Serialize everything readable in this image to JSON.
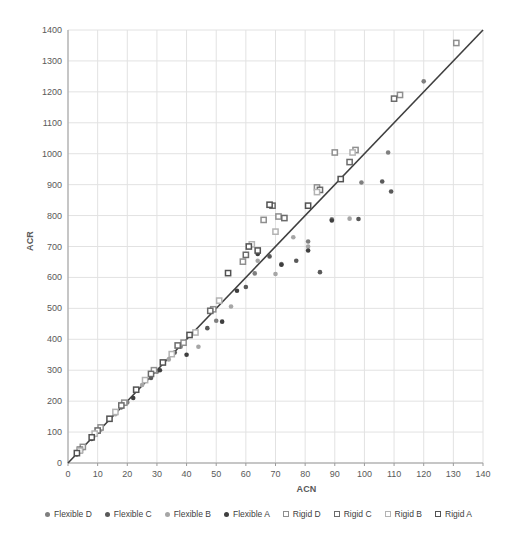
{
  "chart_data": {
    "type": "scatter",
    "title": "",
    "xlabel": "ACN",
    "ylabel": "ACR",
    "xlim": [
      0,
      140
    ],
    "ylim": [
      0,
      1400
    ],
    "xticks": [
      0,
      10,
      20,
      30,
      40,
      50,
      60,
      70,
      80,
      90,
      100,
      110,
      120,
      130,
      140
    ],
    "yticks": [
      0,
      100,
      200,
      300,
      400,
      500,
      600,
      700,
      800,
      900,
      1000,
      1100,
      1200,
      1300,
      1400
    ],
    "grid": true,
    "gridline_color": "#e2e2e2",
    "axis_line_color": "#9b9b9b",
    "tick_label_color": "#595959",
    "legend_position": "bottom",
    "reference_line": {
      "from": [
        0,
        0
      ],
      "to": [
        140,
        1400
      ],
      "color": "#3f3f3f",
      "width": 1.6
    },
    "series": [
      {
        "name": "Flexible D",
        "marker": "circle",
        "color": "#7f7f7f",
        "points": [
          [
            5,
            48
          ],
          [
            11,
            108
          ],
          [
            20,
            196
          ],
          [
            30,
            295
          ],
          [
            38,
            376
          ],
          [
            50,
            460
          ],
          [
            63,
            613
          ],
          [
            72,
            643
          ],
          [
            81,
            716
          ],
          [
            89,
            788
          ],
          [
            99,
            907
          ],
          [
            108,
            1004
          ],
          [
            120,
            1234
          ]
        ]
      },
      {
        "name": "Flexible C",
        "marker": "circle",
        "color": "#595959",
        "points": [
          [
            4,
            40
          ],
          [
            10,
            100
          ],
          [
            18,
            180
          ],
          [
            28,
            275
          ],
          [
            36,
            357
          ],
          [
            47,
            436
          ],
          [
            60,
            569
          ],
          [
            68,
            668
          ],
          [
            77,
            654
          ],
          [
            85,
            617
          ],
          [
            98,
            789
          ],
          [
            106,
            910
          ],
          [
            109,
            878
          ]
        ]
      },
      {
        "name": "Flexible B",
        "marker": "circle",
        "color": "#a6a6a6",
        "points": [
          [
            4,
            36
          ],
          [
            9,
            90
          ],
          [
            16,
            158
          ],
          [
            25,
            252
          ],
          [
            34,
            335
          ],
          [
            44,
            376
          ],
          [
            55,
            506
          ],
          [
            64,
            654
          ],
          [
            70,
            611
          ],
          [
            76,
            730
          ],
          [
            81,
            700
          ],
          [
            95,
            790
          ]
        ]
      },
      {
        "name": "Flexible A",
        "marker": "circle",
        "color": "#3f3f3f",
        "points": [
          [
            3,
            28
          ],
          [
            8,
            78
          ],
          [
            14,
            140
          ],
          [
            22,
            210
          ],
          [
            31,
            300
          ],
          [
            40,
            350
          ],
          [
            52,
            457
          ],
          [
            57,
            557
          ],
          [
            64,
            676
          ],
          [
            72,
            641
          ],
          [
            81,
            687
          ],
          [
            89,
            784
          ]
        ]
      },
      {
        "name": "Rigid D",
        "marker": "square",
        "color": "#8f8f8f",
        "points": [
          [
            5,
            52
          ],
          [
            11,
            115
          ],
          [
            19,
            195
          ],
          [
            29,
            300
          ],
          [
            39,
            389
          ],
          [
            49,
            497
          ],
          [
            59,
            651
          ],
          [
            66,
            786
          ],
          [
            71,
            797
          ],
          [
            84,
            891
          ],
          [
            90,
            1004
          ],
          [
            97,
            1012
          ],
          [
            112,
            1190
          ],
          [
            131,
            1358
          ]
        ]
      },
      {
        "name": "Rigid C",
        "marker": "square",
        "color": "#6b6b6b",
        "points": [
          [
            4,
            43
          ],
          [
            10,
            105
          ],
          [
            18,
            186
          ],
          [
            28,
            288
          ],
          [
            37,
            380
          ],
          [
            48,
            492
          ],
          [
            60,
            673
          ],
          [
            69,
            832
          ],
          [
            73,
            792
          ],
          [
            85,
            883
          ],
          [
            95,
            973
          ],
          [
            110,
            1178
          ]
        ]
      },
      {
        "name": "Rigid B",
        "marker": "square",
        "color": "#b3b3b3",
        "points": [
          [
            4,
            40
          ],
          [
            9,
            95
          ],
          [
            16,
            165
          ],
          [
            26,
            268
          ],
          [
            35,
            352
          ],
          [
            43,
            422
          ],
          [
            51,
            525
          ],
          [
            62,
            707
          ],
          [
            70,
            748
          ],
          [
            84,
            876
          ],
          [
            96,
            1004
          ]
        ]
      },
      {
        "name": "Rigid A",
        "marker": "square",
        "color": "#525252",
        "points": [
          [
            3,
            32
          ],
          [
            8,
            83
          ],
          [
            14,
            143
          ],
          [
            23,
            237
          ],
          [
            32,
            325
          ],
          [
            41,
            414
          ],
          [
            54,
            614
          ],
          [
            61,
            700
          ],
          [
            64,
            687
          ],
          [
            68,
            835
          ],
          [
            81,
            832
          ],
          [
            92,
            918
          ]
        ]
      }
    ]
  }
}
